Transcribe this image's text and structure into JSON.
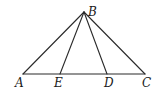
{
  "diagram": {
    "type": "geometry",
    "points": {
      "A": {
        "label": "A",
        "x": 23,
        "y": 74
      },
      "B": {
        "label": "B",
        "x": 84,
        "y": 12
      },
      "C": {
        "label": "C",
        "x": 145,
        "y": 74
      },
      "D": {
        "label": "D",
        "x": 107,
        "y": 74
      },
      "E": {
        "label": "E",
        "x": 60,
        "y": 74
      }
    },
    "segments": [
      "AB",
      "BC",
      "AC",
      "BE",
      "BD"
    ],
    "labels": {
      "A": "A",
      "B": "B",
      "C": "C",
      "D": "D",
      "E": "E"
    },
    "colors": {
      "line": "#2a2a2a",
      "text": "#1a1a1a",
      "background": "#ffffff"
    }
  }
}
